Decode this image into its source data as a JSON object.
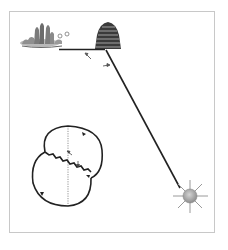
{
  "diagram": {
    "type": "bee waggle dance diagram",
    "elements": {
      "flowers": {
        "label": "food source (flowers)",
        "icon": "flower-patch-icon"
      },
      "hive": {
        "label": "beehive",
        "icon": "beehive-icon"
      },
      "sun": {
        "label": "sun",
        "icon": "sun-icon"
      },
      "angle_arrows": [
        "angle-from-hive-to-food",
        "angle-from-hive-to-sun"
      ],
      "dance": {
        "label": "waggle dance figure-eight",
        "vertical_reference": "gravity line (dotted)"
      }
    },
    "colors": {
      "line": "#222222",
      "frame": "#c8c8c8",
      "sun_fill": "#a8a8a8",
      "sun_rays": "#9a9a9a",
      "hive": "#3a3a3a",
      "flower_leaves": "#7a7a7a"
    }
  }
}
